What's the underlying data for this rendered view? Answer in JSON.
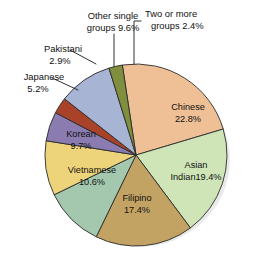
{
  "chart_data": {
    "type": "pie",
    "title": "",
    "subtitle": "",
    "xlabel": "",
    "ylabel": "",
    "legend_position": "none",
    "grid": false,
    "units": "percent",
    "total": 100.0,
    "categories": [
      "Chinese",
      "Asian Indian",
      "Filipino",
      "Vietnamese",
      "Korean",
      "Japanese",
      "Pakistani",
      "Other single groups",
      "Two or more groups"
    ],
    "values": [
      22.8,
      19.4,
      17.4,
      10.6,
      9.7,
      5.2,
      2.9,
      9.6,
      2.4
    ],
    "colors": [
      "#efbf96",
      "#cfe5b8",
      "#c3a363",
      "#a3c8ae",
      "#edd47a",
      "#8a7bb0",
      "#a8432a",
      "#a8b4d4",
      "#7f8f3e"
    ],
    "slices": [
      {
        "name": "Chinese",
        "value": 22.8,
        "color": "#efbf96",
        "label_line1": "Chinese",
        "label_line2": "22.8%",
        "label_placement": "inside"
      },
      {
        "name": "Asian Indian",
        "value": 19.4,
        "color": "#cfe5b8",
        "label_line1": "Asian",
        "label_line2": "Indian19.4%",
        "label_placement": "inside"
      },
      {
        "name": "Filipino",
        "value": 17.4,
        "color": "#c3a363",
        "label_line1": "Filipino",
        "label_line2": "17.4%",
        "label_placement": "inside"
      },
      {
        "name": "Vietnamese",
        "value": 10.6,
        "color": "#a3c8ae",
        "label_line1": "Vietnamese",
        "label_line2": "10.6%",
        "label_placement": "inside"
      },
      {
        "name": "Korean",
        "value": 9.7,
        "color": "#edd47a",
        "label_line1": "Korean",
        "label_line2": "9.7%",
        "label_placement": "inside"
      },
      {
        "name": "Japanese",
        "value": 5.2,
        "color": "#8a7bb0",
        "label_line1": "Japanese",
        "label_line2": "5.2%",
        "label_placement": "outside-left"
      },
      {
        "name": "Pakistani",
        "value": 2.9,
        "color": "#a8432a",
        "label_line1": "Pakistani",
        "label_line2": "2.9%",
        "label_placement": "outside-left"
      },
      {
        "name": "Other single groups",
        "value": 9.6,
        "color": "#a8b4d4",
        "label_line1": "Other single",
        "label_line2": "groups 9.6%",
        "label_placement": "outside-top"
      },
      {
        "name": "Two or more groups",
        "value": 2.4,
        "color": "#7f8f3e",
        "label_line1": "Two or more",
        "label_line2": "groups 2.4%",
        "label_placement": "outside-top-right"
      }
    ]
  }
}
